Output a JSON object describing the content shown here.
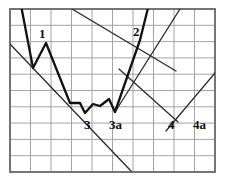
{
  "figure": {
    "kind": "technical-analysis-price-chart",
    "background_color": "#ffffff",
    "grid": {
      "color": "#9a9a9a",
      "border_color": "#6b6b6b",
      "x_left": 10,
      "x_right": 215,
      "y_top": 9,
      "y_bottom": 172,
      "cell_width": 20.5,
      "cell_height": 16.3,
      "columns": 10,
      "rows": 10,
      "visible": true
    },
    "price_line": {
      "color": "#111111",
      "width": 2.3,
      "points": [
        [
          20,
          0
        ],
        [
          33,
          68
        ],
        [
          46,
          43
        ],
        [
          70,
          103
        ],
        [
          80,
          103
        ],
        [
          85,
          113
        ],
        [
          93,
          104
        ],
        [
          100,
          106
        ],
        [
          109,
          99
        ],
        [
          115,
          112
        ],
        [
          140,
          40
        ],
        [
          150,
          0
        ]
      ]
    },
    "trendlines": [
      {
        "name": "upper-descending-resistance",
        "color": "#2b2b2b",
        "width": 1.3,
        "points": [
          [
            72,
            9
          ],
          [
            176,
            71
          ]
        ]
      },
      {
        "name": "lower-descending-support",
        "color": "#2b2b2b",
        "width": 1.3,
        "points": [
          [
            10,
            44
          ],
          [
            131,
            171
          ]
        ]
      },
      {
        "name": "ascending-support-right",
        "color": "#2b2b2b",
        "width": 1.3,
        "points": [
          [
            166,
            131
          ],
          [
            215,
            73
          ]
        ]
      },
      {
        "name": "descending-channel-right",
        "color": "#2b2b2b",
        "width": 1.3,
        "points": [
          [
            119,
            69
          ],
          [
            178,
            122
          ]
        ]
      },
      {
        "name": "ascending-resistance-through-2",
        "color": "#2b2b2b",
        "width": 1.3,
        "points": [
          [
            115,
            112
          ],
          [
            180,
            9
          ]
        ]
      }
    ],
    "labels": [
      {
        "id": "label-1",
        "text": "1",
        "x": 39,
        "y": 27,
        "size": 13
      },
      {
        "id": "label-2",
        "text": "2",
        "x": 133,
        "y": 25,
        "size": 13
      },
      {
        "id": "label-3",
        "text": "3",
        "x": 84,
        "y": 118,
        "size": 13
      },
      {
        "id": "label-3a",
        "text": "3a",
        "x": 109,
        "y": 118,
        "size": 13
      },
      {
        "id": "label-4",
        "text": "4",
        "x": 168,
        "y": 118,
        "size": 13
      },
      {
        "id": "label-4a",
        "text": "4a",
        "x": 193,
        "y": 118,
        "size": 13
      }
    ]
  }
}
